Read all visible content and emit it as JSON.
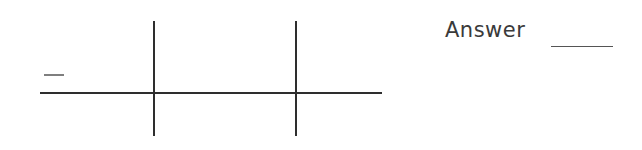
{
  "figure": {
    "line_color": "#2e2e2e",
    "horizontal_line": {
      "x1": 40,
      "x2": 382,
      "y": 93
    },
    "vertical_lines": [
      {
        "x": 154,
        "y1": 21,
        "y2": 136
      },
      {
        "x": 296,
        "y1": 21,
        "y2": 136
      }
    ],
    "dash_mark": {
      "x1": 44,
      "x2": 64,
      "y": 75
    }
  },
  "answer": {
    "label": "Answer",
    "value": ""
  }
}
